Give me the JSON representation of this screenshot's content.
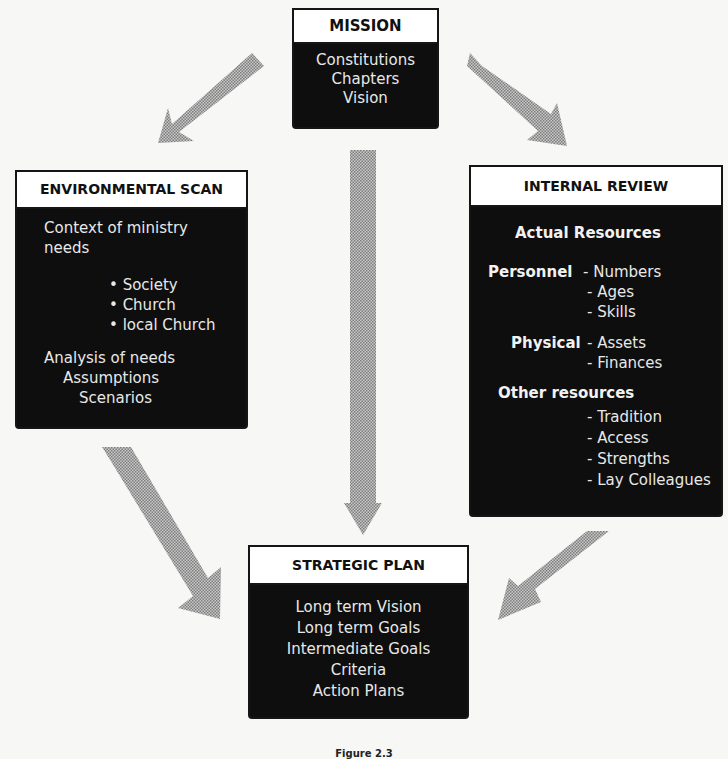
{
  "diagram": {
    "mission": {
      "title": "MISSION",
      "items": [
        "Constitutions",
        "Chapters",
        "Vision"
      ]
    },
    "environmental_scan": {
      "title": "ENVIRONMENTAL SCAN",
      "context_line1": "Context of ministry",
      "context_line2": "needs",
      "bullets": [
        "Society",
        "Church",
        "local Church"
      ],
      "bullet_symbol": "•",
      "analysis": [
        "Analysis of needs",
        "Assumptions",
        "Scenarios"
      ]
    },
    "internal_review": {
      "title": "INTERNAL REVIEW",
      "heading": "Actual Resources",
      "groups": [
        {
          "label": "Personnel",
          "items": [
            "Numbers",
            "Ages",
            "Skills"
          ]
        },
        {
          "label": "Physical",
          "items": [
            "Assets",
            "Finances"
          ]
        },
        {
          "label": "Other resources",
          "items": [
            "Tradition",
            "Access",
            "Strengths",
            "Lay Colleagues"
          ]
        }
      ],
      "dash": "- "
    },
    "strategic_plan": {
      "title": "STRATEGIC PLAN",
      "items": [
        "Long term Vision",
        "Long term Goals",
        "Intermediate Goals",
        "Criteria",
        "Action Plans"
      ]
    },
    "arrows": [
      {
        "from": "mission",
        "to": "environmental_scan"
      },
      {
        "from": "mission",
        "to": "internal_review"
      },
      {
        "from": "mission",
        "to": "strategic_plan"
      },
      {
        "from": "environmental_scan",
        "to": "strategic_plan"
      },
      {
        "from": "internal_review",
        "to": "strategic_plan"
      }
    ],
    "arrow_color": "#9a9a9a",
    "caption": "Figure 2.3"
  }
}
